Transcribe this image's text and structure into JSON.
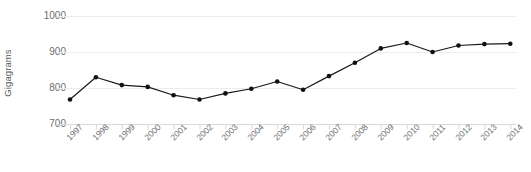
{
  "chart_data": {
    "type": "line",
    "title": "",
    "xlabel": "",
    "ylabel": "Gigagrams",
    "categories": [
      "1997",
      "1998",
      "1999",
      "2000",
      "2001",
      "2002",
      "2003",
      "2004",
      "2005",
      "2006",
      "2007",
      "2008",
      "2009",
      "2010",
      "2011",
      "2012",
      "2013",
      "2014"
    ],
    "values": [
      768,
      830,
      808,
      803,
      780,
      768,
      785,
      798,
      818,
      795,
      833,
      870,
      910,
      925,
      900,
      918,
      922,
      923
    ],
    "yticks": [
      700,
      800,
      900,
      1000
    ],
    "ylim": [
      700,
      1000
    ],
    "grid": true,
    "legend": false,
    "marker": "circle",
    "colors": {
      "line": "#1a1a1a",
      "marker": "#111111",
      "grid": "#ececec",
      "axis": "#d9d9d9",
      "text": "#6d6e71",
      "background": "#ffffff"
    }
  }
}
